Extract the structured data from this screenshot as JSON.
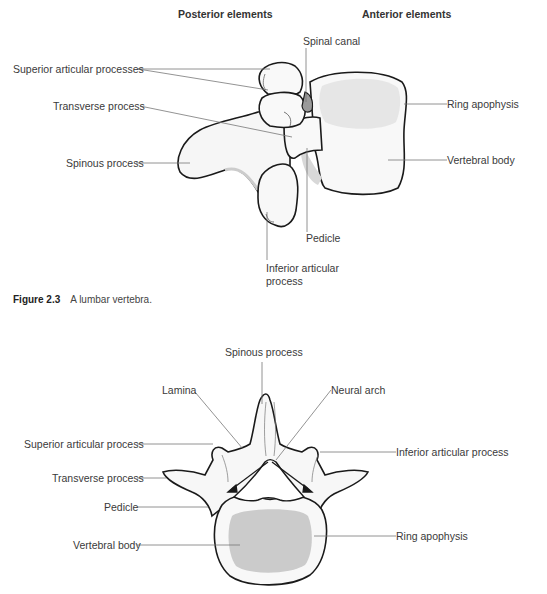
{
  "figure_top": {
    "headers": {
      "posterior": "Posterior elements",
      "anterior": "Anterior elements"
    },
    "labels": {
      "superior_articular": "Superior articular processes",
      "transverse": "Transverse process",
      "spinous": "Spinous process",
      "spinal_canal": "Spinal canal",
      "ring_apophysis": "Ring apophysis",
      "vertebral_body": "Vertebral body",
      "pedicle": "Pedicle",
      "inferior_articular_line1": "Inferior articular",
      "inferior_articular_line2": "process"
    },
    "caption": {
      "number": "Figure 2.3",
      "text": "A lumbar vertebra."
    }
  },
  "figure_bottom": {
    "labels": {
      "spinous": "Spinous process",
      "lamina": "Lamina",
      "neural_arch": "Neural arch",
      "superior_articular": "Superior articular process",
      "inferior_articular": "Inferior articular process",
      "transverse": "Transverse process",
      "pedicle": "Pedicle",
      "vertebral_body": "Vertebral body",
      "ring_apophysis": "Ring apophysis"
    }
  },
  "colors": {
    "outline": "#1a1a1a",
    "leader": "#777777",
    "bone_fill": "#f7f7f7",
    "shade": "#d9d9d9",
    "body_core": "#cccccc"
  }
}
